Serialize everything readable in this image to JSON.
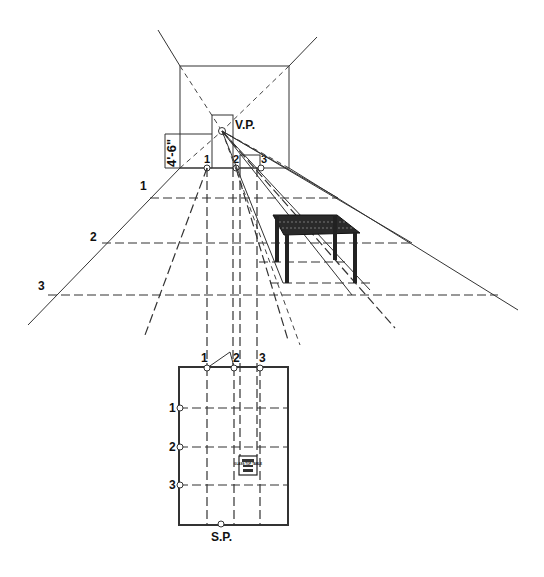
{
  "diagram": {
    "type": "one-point perspective construction",
    "elevation": {
      "vanishing_point_label": "V.P.",
      "height_dimension_label": "4'-6\"",
      "wall_point_labels": [
        "1",
        "2",
        "3"
      ],
      "depth_line_labels": [
        "1",
        "2",
        "3"
      ]
    },
    "plan": {
      "wall_point_labels": [
        "1",
        "2",
        "3"
      ],
      "depth_point_labels": [
        "1",
        "2",
        "3"
      ],
      "station_point_label": "S.P.",
      "object_label": "GLASS TOP TABLE"
    },
    "colors": {
      "line": "#333333",
      "background": "#ffffff",
      "table_fill": "#222222"
    }
  }
}
